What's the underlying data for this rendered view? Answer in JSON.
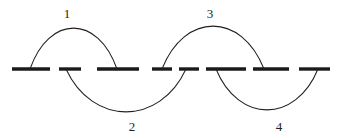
{
  "figure": {
    "type": "chord-matching-diagram",
    "background_color": "#ffffff",
    "stroke_color": "#231f20",
    "baseline_color": "#1a1a1a",
    "width": 339,
    "height": 138,
    "baseline_y": 69
  },
  "baseline": {
    "name": "dashed-baseline",
    "segment_count": 8,
    "thickness": 3.4,
    "segments": [
      {
        "id": "seg-1",
        "x1": 12,
        "x2": 50
      },
      {
        "id": "seg-2",
        "x1": 59,
        "x2": 81
      },
      {
        "id": "seg-3",
        "x1": 97,
        "x2": 139
      },
      {
        "id": "seg-4",
        "x1": 152,
        "x2": 172
      },
      {
        "id": "seg-5",
        "x1": 179,
        "x2": 199
      },
      {
        "id": "seg-6",
        "x1": 206,
        "x2": 246
      },
      {
        "id": "seg-7",
        "x1": 253,
        "x2": 289
      },
      {
        "id": "seg-8",
        "x1": 299,
        "x2": 330
      }
    ]
  },
  "arcs": [
    {
      "id": "arc-1",
      "label": "1",
      "side": "above",
      "start_x": 30,
      "end_x": 117,
      "apex_x": 70,
      "apex_y": 28,
      "label_x": 67,
      "label_y": 18
    },
    {
      "id": "arc-2",
      "label": "2",
      "side": "below",
      "start_x": 66,
      "end_x": 186,
      "apex_x": 131,
      "apex_y": 112,
      "label_x": 132,
      "label_y": 131
    },
    {
      "id": "arc-3",
      "label": "3",
      "side": "above",
      "start_x": 162,
      "end_x": 264,
      "apex_x": 212,
      "apex_y": 26,
      "label_x": 210,
      "label_y": 18
    },
    {
      "id": "arc-4",
      "label": "4",
      "side": "below",
      "start_x": 216,
      "end_x": 318,
      "apex_x": 280,
      "apex_y": 110,
      "label_x": 279,
      "label_y": 131
    }
  ]
}
